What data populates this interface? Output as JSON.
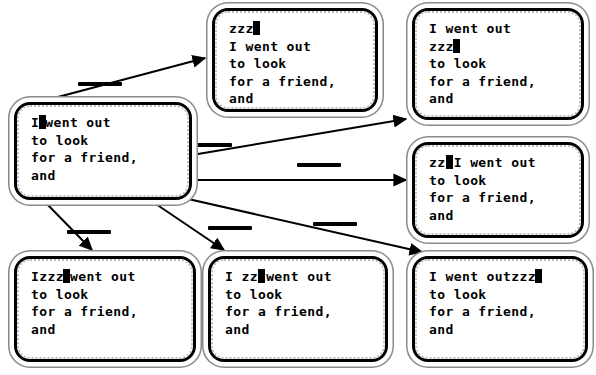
{
  "diagram": {
    "cursor_glyph": "block-cursor",
    "ink_color": "#000000",
    "paper_color": "#ffffff",
    "border_color": "#000000",
    "border_shadow_color": "#8a8a8a",
    "inserted_text": "zzz"
  },
  "nodes": [
    {
      "id": "origin",
      "name": "origin-state",
      "role": "source",
      "lines": [
        {
          "before": "I",
          "cursor": true,
          "cursor_overlaps": false,
          "after": "went out"
        },
        {
          "before": "to look",
          "cursor": false,
          "cursor_overlaps": false,
          "after": ""
        },
        {
          "before": "for a friend,",
          "cursor": false,
          "cursor_overlaps": false,
          "after": ""
        },
        {
          "before": "and",
          "cursor": false,
          "cursor_overlaps": false,
          "after": ""
        }
      ],
      "plain": "I|went out / to look / for a friend, / and"
    },
    {
      "id": "prefix",
      "name": "insert-new-line-above",
      "role": "target",
      "lines": [
        {
          "before": "zzz",
          "cursor": true,
          "cursor_overlaps": false,
          "after": ""
        },
        {
          "before": "I went out",
          "cursor": false,
          "cursor_overlaps": false,
          "after": ""
        },
        {
          "before": "to look",
          "cursor": false,
          "cursor_overlaps": false,
          "after": ""
        },
        {
          "before": "for a friend,",
          "cursor": false,
          "cursor_overlaps": false,
          "after": ""
        },
        {
          "before": "and",
          "cursor": false,
          "cursor_overlaps": false,
          "after": ""
        }
      ],
      "plain": "zzz| / I went out / to look / for a friend, / and"
    },
    {
      "id": "after-line1",
      "name": "insert-new-line-below-first",
      "role": "target",
      "lines": [
        {
          "before": "I went out",
          "cursor": false,
          "cursor_overlaps": false,
          "after": ""
        },
        {
          "before": "zzz",
          "cursor": true,
          "cursor_overlaps": false,
          "after": ""
        },
        {
          "before": "to look",
          "cursor": false,
          "cursor_overlaps": false,
          "after": ""
        },
        {
          "before": "for a friend,",
          "cursor": false,
          "cursor_overlaps": false,
          "after": ""
        },
        {
          "before": "and",
          "cursor": false,
          "cursor_overlaps": false,
          "after": ""
        }
      ],
      "plain": "I went out / zzz| / to look / for a friend, / and"
    },
    {
      "id": "before-i",
      "name": "insert-before-i",
      "role": "target",
      "lines": [
        {
          "before": "zzz",
          "cursor": true,
          "cursor_overlaps": true,
          "after": "I went out"
        },
        {
          "before": "to look",
          "cursor": false,
          "cursor_overlaps": false,
          "after": ""
        },
        {
          "before": "for a friend,",
          "cursor": false,
          "cursor_overlaps": false,
          "after": ""
        },
        {
          "before": "and",
          "cursor": false,
          "cursor_overlaps": false,
          "after": ""
        }
      ],
      "plain": "zzz|I went out / to look / for a friend, / and"
    },
    {
      "id": "after-i",
      "name": "insert-after-i",
      "role": "target",
      "lines": [
        {
          "before": "Izzz",
          "cursor": true,
          "cursor_overlaps": false,
          "after": "went out"
        },
        {
          "before": "to look",
          "cursor": false,
          "cursor_overlaps": false,
          "after": ""
        },
        {
          "before": "for a friend,",
          "cursor": false,
          "cursor_overlaps": false,
          "after": ""
        },
        {
          "before": "and",
          "cursor": false,
          "cursor_overlaps": false,
          "after": ""
        }
      ],
      "plain": "Izzz|went out / to look / for a friend, / and"
    },
    {
      "id": "mid-word",
      "name": "insert-before-went",
      "role": "target",
      "lines": [
        {
          "before": "I zzz",
          "cursor": true,
          "cursor_overlaps": true,
          "after": "went out"
        },
        {
          "before": "to look",
          "cursor": false,
          "cursor_overlaps": false,
          "after": ""
        },
        {
          "before": "for a friend,",
          "cursor": false,
          "cursor_overlaps": false,
          "after": ""
        },
        {
          "before": "and",
          "cursor": false,
          "cursor_overlaps": false,
          "after": ""
        }
      ],
      "plain": "I zzz|went out / to look / for a friend, / and"
    },
    {
      "id": "end-line",
      "name": "insert-at-end-of-line",
      "role": "target",
      "lines": [
        {
          "before": "I went outzzz",
          "cursor": true,
          "cursor_overlaps": false,
          "after": ""
        },
        {
          "before": "to look",
          "cursor": false,
          "cursor_overlaps": false,
          "after": ""
        },
        {
          "before": "for a friend,",
          "cursor": false,
          "cursor_overlaps": false,
          "after": ""
        },
        {
          "before": "and",
          "cursor": false,
          "cursor_overlaps": false,
          "after": ""
        }
      ],
      "plain": "I went outzzz| / to look / for a friend, / and"
    }
  ],
  "edges": [
    {
      "id": "e1",
      "from": "origin",
      "to": "prefix",
      "label": ""
    },
    {
      "id": "e2",
      "from": "origin",
      "to": "after-line1",
      "label": ""
    },
    {
      "id": "e3",
      "from": "origin",
      "to": "before-i",
      "label": ""
    },
    {
      "id": "e4",
      "from": "origin",
      "to": "after-i",
      "label": ""
    },
    {
      "id": "e5",
      "from": "origin",
      "to": "mid-word",
      "label": ""
    },
    {
      "id": "e6",
      "from": "origin",
      "to": "end-line",
      "label": ""
    }
  ]
}
